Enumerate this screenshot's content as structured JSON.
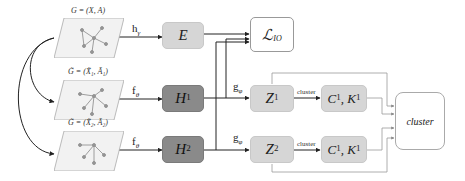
{
  "graphs": [
    {
      "id": "original",
      "label": "G = (X, A)",
      "edge_label": "h",
      "edge_sub": "γ"
    },
    {
      "id": "augmented-1",
      "label": "G̃ = (X̃₁, Ã₁)",
      "edge_label": "f",
      "edge_sub": "θ"
    },
    {
      "id": "augmented-2",
      "label": "G̃ = (X̃₂, Ã₂)",
      "edge_label": "f",
      "edge_sub": "θ"
    }
  ],
  "nodes": {
    "E": {
      "label": "E"
    },
    "H1": {
      "label": "H",
      "sup": "1"
    },
    "H2": {
      "label": "H",
      "sup": "2"
    },
    "Z1": {
      "label": "Z",
      "sup": "1"
    },
    "Z2": {
      "label": "Z",
      "sup": "2"
    },
    "loss": {
      "label": "ℒ",
      "sub": "IO"
    },
    "CK1": {
      "label": "C",
      "sup1": "1",
      "mid": ", K",
      "sup2": "1"
    },
    "CK2": {
      "label": "C",
      "sup1": "1",
      "mid": ", K",
      "sup2": "1"
    },
    "cluster": {
      "label": "cluster"
    }
  },
  "edges": {
    "g_label": "g",
    "g_sub": "φ",
    "cluster_label_1": "cluster",
    "cluster_label_2": "cluster"
  },
  "colors": {
    "light_box": "#d6d6d6",
    "dark_box": "#8a8a8a",
    "white_box": "#ffffff",
    "wire": "#333333"
  }
}
